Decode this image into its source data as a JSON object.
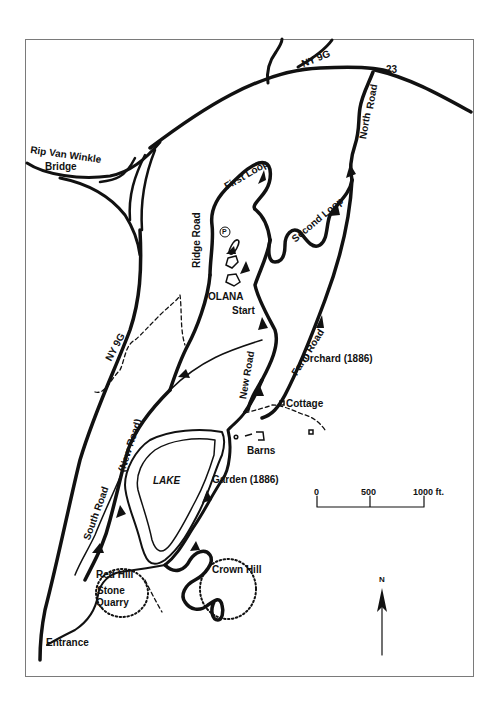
{
  "map": {
    "title": "Olana estate carriage roads",
    "roads": {
      "ny9g_top": "NY 9G",
      "ny9g_west": "NY 9G",
      "route23": "23",
      "bridge": "Rip Van Winkle",
      "bridge_line2": "Bridge",
      "north_road_1": "North",
      "north_road_2": "Road",
      "first_loop": "First Loop",
      "second_loop": "Second Loop",
      "ridge_road": "Ridge Road",
      "farm_road": "Farm Road",
      "new_road_east": "New Road",
      "new_road_west": "(New Road)",
      "south_road": "South Road"
    },
    "places": {
      "olana": "OLANA",
      "start": "Start",
      "parking": "P",
      "orchard": "Orchard (1886)",
      "cottage": "Cottage",
      "barns": "Barns",
      "lake": "LAKE",
      "garden": "Garden (1886)",
      "red_hill": "Red Hill",
      "stone": "Stone",
      "quarry": "Quarry",
      "crown_hill": "Crown Hill",
      "entrance": "Entrance"
    },
    "scale": {
      "tick_0": "0",
      "tick_500": "500",
      "tick_1000": "1000 ft."
    },
    "north_arrow": "N",
    "colors": {
      "ink": "#111111",
      "frame": "#7a7a7a",
      "background": "#ffffff"
    }
  }
}
